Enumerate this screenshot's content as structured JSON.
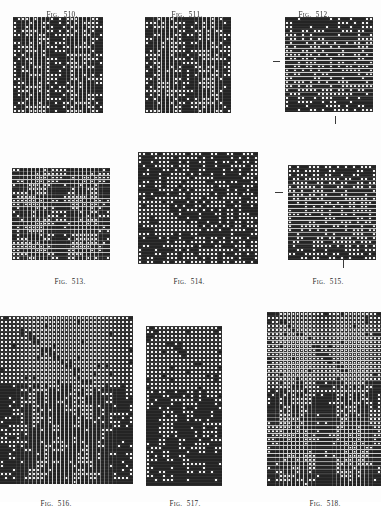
{
  "page": {
    "background": "#fdfdfd",
    "ink": "#2b2b2b",
    "cell_dark": "#242424",
    "cell_light": "#f2f2f2",
    "grid_line": "#ffffff"
  },
  "caption_prefix_first": "F",
  "caption_prefix_small": "IG",
  "caption_dot": ".",
  "figures": [
    {
      "id": "fig-510",
      "number": "510.",
      "caption": "FIG. 510.",
      "caption_position": "top",
      "caption_x": 33,
      "caption_y": 3,
      "caption_w": 58,
      "grid_x": 13,
      "grid_y": 17,
      "grid_w": 90,
      "grid_h": 96,
      "cols": 22,
      "rows": 24,
      "seed": 5101,
      "density": 0.5,
      "pattern": "random-twill",
      "style": "open",
      "ticks": []
    },
    {
      "id": "fig-511",
      "number": "511.",
      "caption": "FIG. 511.",
      "caption_position": "top",
      "caption_x": 158,
      "caption_y": 3,
      "caption_w": 58,
      "grid_x": 145,
      "grid_y": 17,
      "grid_w": 86,
      "grid_h": 96,
      "cols": 21,
      "rows": 24,
      "seed": 5112,
      "density": 0.5,
      "pattern": "random-twill",
      "style": "open",
      "ticks": []
    },
    {
      "id": "fig-512",
      "number": "512.",
      "caption": "FIG. 512.",
      "caption_position": "top",
      "caption_x": 285,
      "caption_y": 3,
      "caption_w": 58,
      "grid_x": 285,
      "grid_y": 17,
      "grid_w": 88,
      "grid_h": 95,
      "cols": 22,
      "rows": 24,
      "seed": 5123,
      "density": 0.52,
      "pattern": "random-twill",
      "style": "open",
      "ticks": [
        {
          "type": "horizontal",
          "x": 273,
          "y": 61,
          "len": 7
        },
        {
          "type": "vertical",
          "x": 335,
          "y": 116,
          "len": 8
        }
      ]
    },
    {
      "id": "fig-513",
      "number": "513.",
      "caption": "FIG. 513.",
      "caption_position": "bottom",
      "caption_x": 41,
      "caption_y": 270,
      "caption_w": 58,
      "grid_x": 12,
      "grid_y": 168,
      "grid_w": 98,
      "grid_h": 92,
      "cols": 25,
      "rows": 24,
      "seed": 5134,
      "density": 0.45,
      "pattern": "diagonal-blotch",
      "style": "open",
      "ticks": []
    },
    {
      "id": "fig-514",
      "number": "514.",
      "caption": "FIG. 514.",
      "caption_position": "bottom",
      "caption_x": 160,
      "caption_y": 270,
      "caption_w": 58,
      "grid_x": 138,
      "grid_y": 152,
      "grid_w": 120,
      "grid_h": 112,
      "cols": 30,
      "rows": 28,
      "seed": 5145,
      "density": 0.33,
      "pattern": "sparse-scatter",
      "style": "open",
      "ticks": []
    },
    {
      "id": "fig-515",
      "number": "515.",
      "caption": "FIG. 515.",
      "caption_position": "bottom",
      "caption_x": 299,
      "caption_y": 270,
      "caption_w": 58,
      "grid_x": 288,
      "grid_y": 165,
      "grid_w": 88,
      "grid_h": 95,
      "cols": 22,
      "rows": 24,
      "seed": 5156,
      "density": 0.48,
      "pattern": "random-twill",
      "style": "open",
      "ticks": [
        {
          "type": "horizontal",
          "x": 275,
          "y": 192,
          "len": 8
        },
        {
          "type": "vertical",
          "x": 343,
          "y": 260,
          "len": 8
        }
      ]
    },
    {
      "id": "fig-516",
      "number": "516.",
      "caption": "FIG. 516.",
      "caption_position": "bottom",
      "caption_x": 27,
      "caption_y": 492,
      "caption_w": 58,
      "grid_x": 0,
      "grid_y": 316,
      "grid_w": 133,
      "grid_h": 168,
      "cols": 33,
      "rows": 42,
      "seed": 5167,
      "density": 0.5,
      "pattern": "split-field",
      "split_ratio": 0.42,
      "style": "open",
      "ticks": []
    },
    {
      "id": "fig-517",
      "number": "517.",
      "caption": "FIG. 517.",
      "caption_position": "bottom",
      "caption_x": 156,
      "caption_y": 492,
      "caption_w": 58,
      "grid_x": 146,
      "grid_y": 326,
      "grid_w": 76,
      "grid_h": 160,
      "cols": 19,
      "rows": 40,
      "seed": 5178,
      "density": 0.5,
      "pattern": "split-field",
      "split_ratio": 0.4,
      "style": "open",
      "ticks": []
    },
    {
      "id": "fig-518",
      "number": "518.",
      "caption": "FIG. 518.",
      "caption_position": "bottom",
      "caption_x": 296,
      "caption_y": 492,
      "caption_w": 58,
      "grid_x": 267,
      "grid_y": 312,
      "grid_w": 114,
      "grid_h": 174,
      "cols": 28,
      "rows": 43,
      "seed": 5189,
      "density": 0.55,
      "pattern": "split-field",
      "split_ratio": 0.4,
      "style": "open",
      "ticks": []
    }
  ]
}
